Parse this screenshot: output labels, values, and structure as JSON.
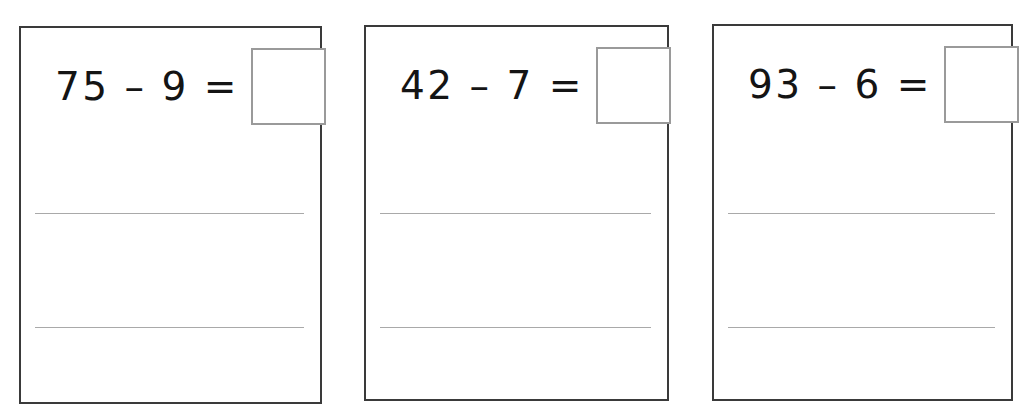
{
  "worksheet": {
    "title": "Subtraction Problem Cards",
    "background_color": "#ffffff",
    "card_border_color": "#3a3a3a",
    "answer_box_border_color": "#9a9a9a",
    "rule_line_color": "#8c8c8c",
    "text_color": "#141414"
  },
  "cards": [
    {
      "id": "card-1",
      "equation": "75 – 9 =",
      "minuend": "75",
      "operator": "–",
      "subtrahend": "9",
      "equals": "=",
      "answer": "",
      "answer_placeholder": "",
      "writing_lines": 2
    },
    {
      "id": "card-2",
      "equation": "42 – 7 =",
      "minuend": "42",
      "operator": "–",
      "subtrahend": "7",
      "equals": "=",
      "answer": "",
      "answer_placeholder": "",
      "writing_lines": 2
    },
    {
      "id": "card-3",
      "equation": "93 – 6 =",
      "minuend": "93",
      "operator": "–",
      "subtrahend": "6",
      "equals": "=",
      "answer": "",
      "answer_placeholder": "",
      "writing_lines": 2
    }
  ]
}
